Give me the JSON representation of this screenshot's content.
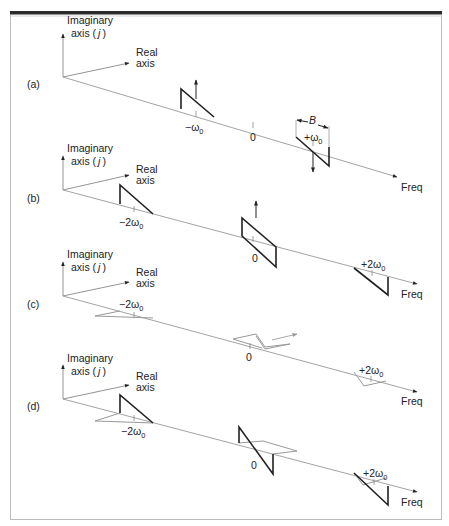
{
  "figure": {
    "panels": [
      {
        "id": "a",
        "label": "(a)",
        "imag_axis_label_1": "Imaginary",
        "imag_axis_label_2": "axis (",
        "imag_axis_j": "j",
        "imag_axis_close": ")",
        "real_axis_label_1": "Real",
        "real_axis_label_2": "axis",
        "freq_label": "Freq",
        "ticks": [
          "−ω",
          "0",
          "+ω"
        ],
        "tick_subscript": "0",
        "bandwidth_label": "B"
      },
      {
        "id": "b",
        "label": "(b)",
        "imag_axis_label_1": "Imaginary",
        "imag_axis_label_2": "axis (",
        "imag_axis_j": "j",
        "imag_axis_close": ")",
        "real_axis_label_1": "Real",
        "real_axis_label_2": "axis",
        "freq_label": "Freq",
        "ticks": [
          "−2ω",
          "0",
          "+2ω"
        ],
        "tick_subscript": "0"
      },
      {
        "id": "c",
        "label": "(c)",
        "imag_axis_label_1": "Imaginary",
        "imag_axis_label_2": "axis (",
        "imag_axis_j": "j",
        "imag_axis_close": ")",
        "real_axis_label_1": "Real",
        "real_axis_label_2": "axis",
        "freq_label": "Freq",
        "ticks": [
          "−2ω",
          "0",
          "+2ω"
        ],
        "tick_subscript": "0"
      },
      {
        "id": "d",
        "label": "(d)",
        "imag_axis_label_1": "Imaginary",
        "imag_axis_label_2": "axis (",
        "imag_axis_j": "j",
        "imag_axis_close": ")",
        "real_axis_label_1": "Real",
        "real_axis_label_2": "axis",
        "freq_label": "Freq",
        "ticks": [
          "−2ω",
          "0",
          "+2ω"
        ],
        "tick_subscript": "0"
      }
    ],
    "colors": {
      "frame_bar": "#2a2a2a",
      "frame_border": "#bbbbbb",
      "axis": "#999999",
      "spectrum_dark": "#222222",
      "spectrum_light": "#999999"
    }
  }
}
